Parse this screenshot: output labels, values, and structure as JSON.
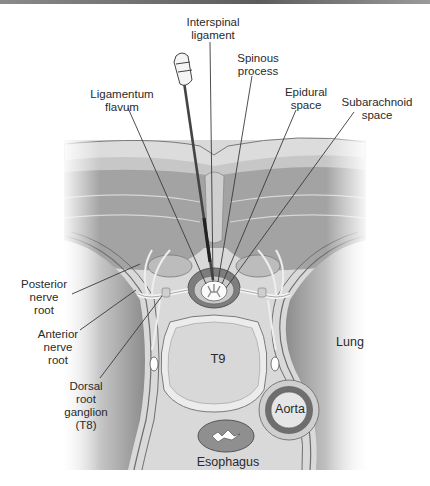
{
  "labels": {
    "interspinal_ligament": "Interspinal\nligament",
    "spinous_process": "Spinous\nprocess",
    "ligamentum_flavum": "Ligamentum\nflavum",
    "epidural_space": "Epidural\nspace",
    "subarachnoid_space": "Subarachnoid\nspace",
    "posterior_nerve_root": "Posterior\nnerve\nroot",
    "anterior_nerve_root": "Anterior\nnerve\nroot",
    "dorsal_root_ganglion": "Dorsal\nroot\nganglion\n(T8)",
    "vertebral_body": "T9",
    "lung": "Lung",
    "aorta": "Aorta",
    "esophagus": "Esophagus"
  },
  "colors": {
    "skin": "#d4d4d4",
    "fat": "#c4c4c4",
    "muscle": "#9e9e9e",
    "bone": "#dcdcdc",
    "outline": "#6a6a6a",
    "leader": "#3a3a3a",
    "lung": "#b8b8b8"
  }
}
